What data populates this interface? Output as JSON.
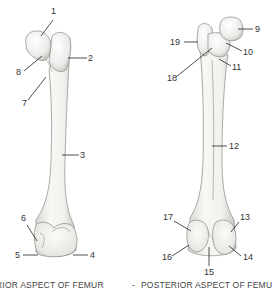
{
  "diagram": {
    "subject": "Femur",
    "views": [
      {
        "id": "anterior",
        "caption": "ANTERIOR ASPECT OF FEMUR",
        "caption_visible": "RIOR ASPECT OF FEMUR",
        "labels": [
          {
            "num": "1",
            "x": 23,
            "y": 14
          },
          {
            "num": "2",
            "x": 87,
            "y": 55
          },
          {
            "num": "3",
            "x": 80,
            "y": 151
          },
          {
            "num": "4",
            "x": 91,
            "y": 251
          },
          {
            "num": "5",
            "x": 15,
            "y": 251
          },
          {
            "num": "6",
            "x": 22,
            "y": 214
          },
          {
            "num": "7",
            "x": 24,
            "y": 98
          },
          {
            "num": "8",
            "x": 16,
            "y": 68
          }
        ]
      },
      {
        "id": "posterior",
        "caption": "POSTERIOR ASPECT OF FEMUR",
        "caption_visible": "POSTERIOR ASPECT OF FEMU",
        "labels": [
          {
            "num": "9",
            "x": 255,
            "y": 25
          },
          {
            "num": "10",
            "x": 243,
            "y": 47
          },
          {
            "num": "11",
            "x": 233,
            "y": 63
          },
          {
            "num": "12",
            "x": 229,
            "y": 142
          },
          {
            "num": "13",
            "x": 240,
            "y": 212
          },
          {
            "num": "14",
            "x": 243,
            "y": 252
          },
          {
            "num": "15",
            "x": 204,
            "y": 268
          },
          {
            "num": "16",
            "x": 162,
            "y": 252
          },
          {
            "num": "17",
            "x": 164,
            "y": 212
          },
          {
            "num": "18",
            "x": 167,
            "y": 73
          },
          {
            "num": "19",
            "x": 170,
            "y": 38
          }
        ]
      }
    ],
    "separator": "-",
    "colors": {
      "bone_fill": "#f3f3f0",
      "bone_shadow": "#c9c9c4",
      "outline": "#8a8a86",
      "label_text": "#333333",
      "leader_line": "#222222"
    }
  }
}
